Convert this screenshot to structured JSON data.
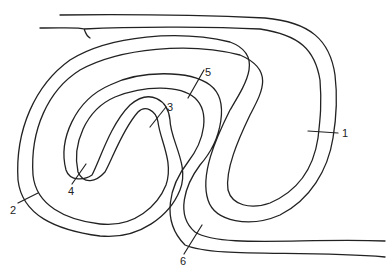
{
  "diagram": {
    "type": "folded-layer-cross-section",
    "stroke_color": "#222222",
    "background": "#ffffff",
    "labels": [
      {
        "id": "1",
        "text": "1",
        "x": 338,
        "y": 137
      },
      {
        "id": "2",
        "text": "2",
        "x": 10,
        "y": 213
      },
      {
        "id": "3",
        "text": "3",
        "x": 167,
        "y": 111
      },
      {
        "id": "4",
        "text": "4",
        "x": 69,
        "y": 193
      },
      {
        "id": "5",
        "text": "5",
        "x": 205,
        "y": 76
      },
      {
        "id": "6",
        "text": "6",
        "x": 180,
        "y": 262
      }
    ]
  }
}
